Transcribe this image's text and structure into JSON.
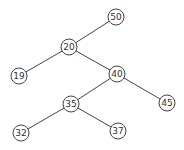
{
  "diagram": {
    "type": "binary-tree",
    "nodes": [
      {
        "id": "n50",
        "label": "50",
        "x": 116,
        "y": 17
      },
      {
        "id": "n20",
        "label": "20",
        "x": 69,
        "y": 47
      },
      {
        "id": "n19",
        "label": "19",
        "x": 19,
        "y": 76
      },
      {
        "id": "n40",
        "label": "40",
        "x": 117,
        "y": 74
      },
      {
        "id": "n45",
        "label": "45",
        "x": 167,
        "y": 103
      },
      {
        "id": "n35",
        "label": "35",
        "x": 71,
        "y": 104
      },
      {
        "id": "n32",
        "label": "32",
        "x": 21,
        "y": 133
      },
      {
        "id": "n37",
        "label": "37",
        "x": 118,
        "y": 131
      }
    ],
    "edges": [
      [
        "n50",
        "n20"
      ],
      [
        "n20",
        "n19"
      ],
      [
        "n20",
        "n40"
      ],
      [
        "n40",
        "n35"
      ],
      [
        "n40",
        "n45"
      ],
      [
        "n35",
        "n32"
      ],
      [
        "n35",
        "n37"
      ]
    ]
  }
}
